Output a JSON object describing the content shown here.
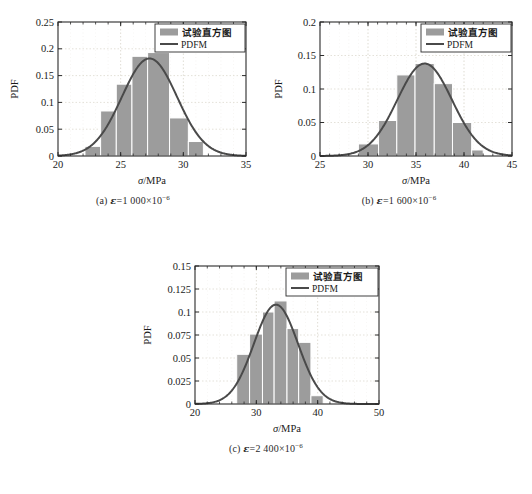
{
  "figure": {
    "panels": [
      {
        "id": "a",
        "caption_prefix": "(a) ",
        "caption_symbol": "ε",
        "caption_eq": "=1 000×10",
        "caption_exp": "−6",
        "xlabel_symbol": "σ",
        "xlabel_unit": "/MPa",
        "ylabel": "PDF",
        "legend": [
          {
            "label": "试验直方图",
            "type": "swatch",
            "color": "#9c9c9c"
          },
          {
            "label": "PDFM",
            "type": "line",
            "color": "#4a4a4a"
          }
        ],
        "chart_data": {
          "type": "bar",
          "title": "",
          "xlabel": "σ/MPa",
          "ylabel": "PDF",
          "xlim": [
            20,
            35
          ],
          "ylim": [
            0,
            0.25
          ],
          "xticks": [
            20,
            25,
            30,
            35
          ],
          "xtick_labels": [
            "20",
            "25",
            "30",
            "35"
          ],
          "yticks": [
            0,
            0.05,
            0.1,
            0.15,
            0.2,
            0.25
          ],
          "ytick_labels": [
            "0",
            "0.05",
            "0.1",
            "0.15",
            "0.2",
            "0.25"
          ],
          "grid": true,
          "bar_edges": [
            22.15,
            23.4,
            24.65,
            25.9,
            27.15,
            28.4,
            29.65,
            30.9,
            31.6
          ],
          "bars": [
            {
              "x0": 22.15,
              "x1": 23.4,
              "value": 0.018
            },
            {
              "x0": 23.4,
              "x1": 24.65,
              "value": 0.084
            },
            {
              "x0": 24.65,
              "x1": 25.9,
              "value": 0.134
            },
            {
              "x0": 25.9,
              "x1": 27.15,
              "value": 0.186
            },
            {
              "x0": 27.15,
              "x1": 28.9,
              "value": 0.193
            },
            {
              "x0": 28.9,
              "x1": 30.4,
              "value": 0.071
            },
            {
              "x0": 30.4,
              "x1": 31.6,
              "value": 0.027
            }
          ],
          "curve": {
            "name": "PDFM",
            "mean": 27.3,
            "sigma": 2.2,
            "peak": 0.182,
            "color": "#4a4a4a"
          }
        }
      },
      {
        "id": "b",
        "caption_prefix": "(b) ",
        "caption_symbol": "ε",
        "caption_eq": "=1 600×10",
        "caption_exp": "−6",
        "xlabel_symbol": "σ",
        "xlabel_unit": "/MPa",
        "ylabel": "PDF",
        "legend": [
          {
            "label": "试验直方图",
            "type": "swatch",
            "color": "#9c9c9c"
          },
          {
            "label": "PDFM",
            "type": "line",
            "color": "#4a4a4a"
          }
        ],
        "chart_data": {
          "type": "bar",
          "title": "",
          "xlabel": "σ/MPa",
          "ylabel": "PDF",
          "xlim": [
            25,
            45
          ],
          "ylim": [
            0,
            0.2
          ],
          "xticks": [
            25,
            30,
            35,
            40,
            45
          ],
          "xtick_labels": [
            "25",
            "30",
            "35",
            "40",
            "45"
          ],
          "yticks": [
            0,
            0.05,
            0.1,
            0.15,
            0.2
          ],
          "ytick_labels": [
            "0",
            "0.05",
            "0.1",
            "0.15",
            "0.2"
          ],
          "grid": true,
          "bars": [
            {
              "x0": 29.0,
              "x1": 31.1,
              "value": 0.018
            },
            {
              "x0": 31.1,
              "x1": 33.0,
              "value": 0.053
            },
            {
              "x0": 33.0,
              "x1": 34.9,
              "value": 0.121
            },
            {
              "x0": 34.9,
              "x1": 36.9,
              "value": 0.138
            },
            {
              "x0": 36.9,
              "x1": 38.8,
              "value": 0.108
            },
            {
              "x0": 38.8,
              "x1": 40.8,
              "value": 0.05
            },
            {
              "x0": 40.8,
              "x1": 42.0,
              "value": 0.009
            }
          ],
          "curve": {
            "name": "PDFM",
            "mean": 35.9,
            "sigma": 2.85,
            "peak": 0.138,
            "color": "#4a4a4a"
          }
        }
      },
      {
        "id": "c",
        "caption_prefix": "(c) ",
        "caption_symbol": "ε",
        "caption_eq": "=2 400×10",
        "caption_exp": "−6",
        "xlabel_symbol": "σ",
        "xlabel_unit": "/MPa",
        "ylabel": "PDF",
        "legend": [
          {
            "label": "试验直方图",
            "type": "swatch",
            "color": "#9c9c9c"
          },
          {
            "label": "PDFM",
            "type": "line",
            "color": "#4a4a4a"
          }
        ],
        "chart_data": {
          "type": "bar",
          "title": "",
          "xlabel": "σ/MPa",
          "ylabel": "PDF",
          "xlim": [
            20,
            50
          ],
          "ylim": [
            0,
            0.15
          ],
          "xticks": [
            20,
            30,
            40,
            50
          ],
          "xtick_labels": [
            "20",
            "30",
            "40",
            "50"
          ],
          "yticks": [
            0,
            0.025,
            0.05,
            0.075,
            0.1,
            0.125,
            0.15
          ],
          "ytick_labels": [
            "0",
            "0.025",
            "0.05",
            "0.075",
            "0.1",
            "0.125",
            "0.15"
          ],
          "grid": true,
          "bars": [
            {
              "x0": 26.8,
              "x1": 28.9,
              "value": 0.054
            },
            {
              "x0": 28.9,
              "x1": 31.0,
              "value": 0.076
            },
            {
              "x0": 31.0,
              "x1": 32.9,
              "value": 0.1
            },
            {
              "x0": 32.9,
              "x1": 35.0,
              "value": 0.112
            },
            {
              "x0": 35.0,
              "x1": 36.9,
              "value": 0.082
            },
            {
              "x0": 36.9,
              "x1": 38.9,
              "value": 0.067
            },
            {
              "x0": 38.9,
              "x1": 40.9,
              "value": 0.009
            }
          ],
          "curve": {
            "name": "PDFM",
            "mean": 33.2,
            "sigma": 3.6,
            "peak": 0.108,
            "color": "#4a4a4a"
          }
        }
      }
    ],
    "style": {
      "bar_fill": "#9c9c9c",
      "bar_edge": "#ffffff",
      "curve_color": "#4a4a4a",
      "axis_color": "#2b2b2b",
      "grid_color": "#d9d4c9",
      "background": "#ffffff"
    }
  }
}
